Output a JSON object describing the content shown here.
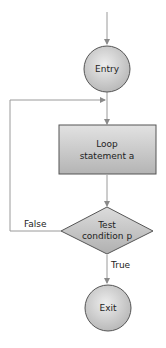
{
  "diagram": {
    "type": "flowchart",
    "colors": {
      "line": "#9a9a9a",
      "node_border": "#555555",
      "node_fill_light": "#ececec",
      "node_fill_dark": "#b8b8b8",
      "text": "#222222"
    },
    "nodes": [
      {
        "id": "entry",
        "shape": "circle",
        "label": "Entry"
      },
      {
        "id": "loop",
        "shape": "rectangle",
        "label_line1": "Loop",
        "label_line2": "statement a"
      },
      {
        "id": "test",
        "shape": "diamond",
        "label_line1": "Test",
        "label_line2": "condition p"
      },
      {
        "id": "exit",
        "shape": "circle",
        "label": "Exit"
      }
    ],
    "edges": [
      {
        "from": "start",
        "to": "entry",
        "label": ""
      },
      {
        "from": "entry",
        "to": "loop",
        "label": ""
      },
      {
        "from": "loop",
        "to": "test",
        "label": ""
      },
      {
        "from": "test",
        "to": "loop",
        "label": "False"
      },
      {
        "from": "test",
        "to": "exit",
        "label": "True"
      }
    ]
  },
  "labels": {
    "entry": "Entry",
    "loop_line1": "Loop",
    "loop_line2": "statement a",
    "test_line1": "Test",
    "test_line2": "condition p",
    "exit": "Exit",
    "false_edge": "False",
    "true_edge": "True"
  }
}
